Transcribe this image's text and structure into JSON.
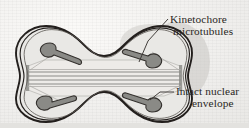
{
  "figure": {
    "name": "mitosis-intact-nuclear-envelope-diagram",
    "background_color": "#f2f1ef",
    "ink_color": "#2a2724"
  },
  "labels": {
    "kinetochore": {
      "line1": "Kinetochore",
      "line2": "microtubules",
      "icon": "leader-line-icon"
    },
    "envelope": {
      "line1": "Intact nuclear",
      "line2": "envelope",
      "icon": "leader-line-icon"
    }
  },
  "structures": {
    "nuclear_envelope": {
      "name": "Intact nuclear envelope",
      "shape": "dumbbell",
      "membrane_layers": 3,
      "color": "#231f1d",
      "fill": "#e8e7e4"
    },
    "spindle": {
      "name": "Kinetochore microtubules",
      "orientation": "horizontal",
      "filament_count": 5,
      "color": "#8c8c88",
      "envelope_fill": "#eceae7"
    },
    "chromosomes": {
      "count": 4,
      "shape": "V-shaped",
      "fill": "#8a8a86",
      "outline": "#333330",
      "positions": [
        "upper-left",
        "lower-left",
        "upper-right",
        "lower-right"
      ]
    },
    "shadow": {
      "name": "cell-shadow",
      "color": "#c9c7c3"
    }
  }
}
